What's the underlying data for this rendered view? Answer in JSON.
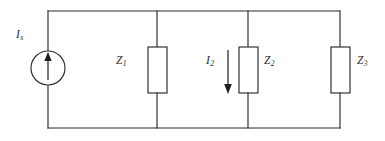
{
  "figure": {
    "background_color": "#ffffff",
    "line_color": "#2b2b2b",
    "width": 385,
    "height": 141
  },
  "labels": {
    "source_current": {
      "symbol": "I",
      "subscript": "s"
    },
    "impedance_1": {
      "symbol": "Z",
      "subscript": "1"
    },
    "branch_current_2": {
      "symbol": "I",
      "subscript": "2"
    },
    "impedance_2": {
      "symbol": "Z",
      "subscript": "2"
    },
    "impedance_3": {
      "symbol": "Z",
      "subscript": "3"
    }
  },
  "circuit": {
    "type": "schematic",
    "topology": "single current source feeding three parallel impedance branches",
    "top_rail": {
      "y": 11,
      "x_start": 48,
      "x_end": 340
    },
    "bottom_rail": {
      "y": 128,
      "x_start": 48,
      "x_end": 340
    },
    "nodes": [
      {
        "name": "source-branch",
        "x": 48
      },
      {
        "name": "z1-branch",
        "x": 157
      },
      {
        "name": "z2-branch",
        "x": 248
      },
      {
        "name": "z3-branch",
        "x": 340
      }
    ],
    "components": [
      {
        "name": "current-source",
        "kind": "current-source",
        "shape": "circle",
        "center_x": 48,
        "center_y": 68,
        "radius": 17,
        "arrow_direction": "up",
        "label": "Is"
      },
      {
        "name": "impedance-z1",
        "kind": "impedance",
        "shape": "rectangle",
        "x": 148,
        "y": 47,
        "width": 19,
        "height": 46,
        "label": "Z1"
      },
      {
        "name": "impedance-z2",
        "kind": "impedance",
        "shape": "rectangle",
        "x": 239,
        "y": 47,
        "width": 19,
        "height": 46,
        "label": "Z2"
      },
      {
        "name": "impedance-z3",
        "kind": "impedance",
        "shape": "rectangle",
        "x": 331,
        "y": 47,
        "width": 19,
        "height": 46,
        "label": "Z3"
      }
    ],
    "current_arrows": [
      {
        "name": "source-current-arrow",
        "direction": "up",
        "x": 48,
        "y_start": 79,
        "y_end": 54,
        "label": "Is"
      },
      {
        "name": "branch-current-arrow-i2",
        "direction": "down",
        "x": 228,
        "y_start": 50,
        "y_end": 93,
        "label": "I2"
      }
    ]
  }
}
